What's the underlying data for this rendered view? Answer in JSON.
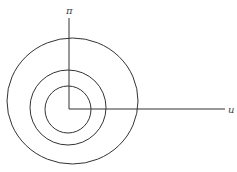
{
  "diagram": {
    "type": "concentric-circles-with-axes",
    "line_color": "#333333",
    "axes": {
      "vertical_label": "π",
      "horizontal_label": "u"
    },
    "circles": [
      {
        "name": "outer",
        "cx": 72.5,
        "cy": 101,
        "rx": 65.5,
        "ry": 63
      },
      {
        "name": "middle",
        "cx": 68,
        "cy": 107.5,
        "rx": 38,
        "ry": 37.5
      },
      {
        "name": "inner",
        "cx": 68,
        "cy": 109.5,
        "rx": 23,
        "ry": 23.5
      }
    ]
  }
}
